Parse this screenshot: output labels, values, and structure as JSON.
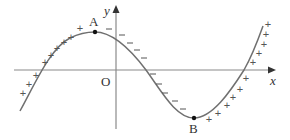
{
  "diagram": {
    "type": "function-graph-sign-chart",
    "axes": {
      "x_label": "x",
      "y_label": "y",
      "origin_label": "O"
    },
    "points": [
      {
        "label": "A",
        "role": "local maximum"
      },
      {
        "label": "B",
        "role": "local minimum"
      }
    ],
    "sign_regions": [
      {
        "segment": "left of A (increasing)",
        "sign": "+",
        "count": 10
      },
      {
        "segment": "between A and B (decreasing)",
        "sign": "−",
        "count": 11
      },
      {
        "segment": "right of B (increasing)",
        "sign": "+",
        "count": 11
      }
    ],
    "colors": {
      "axis": "#8a8a8a",
      "curve": "#707070",
      "text": "#333333",
      "signs": "#555555",
      "points": "#111111"
    }
  }
}
